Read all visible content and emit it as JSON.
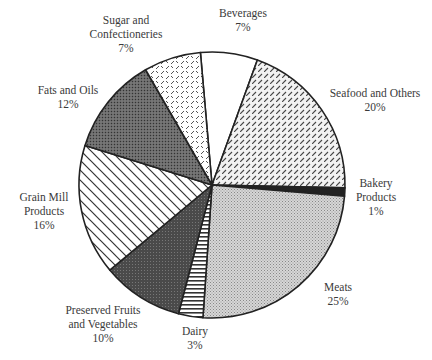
{
  "chart_data": {
    "type": "pie",
    "title": "",
    "start_angle_deg": -5,
    "direction": "clockwise",
    "center": [
      212,
      185
    ],
    "radius": 133,
    "slices": [
      {
        "label": "Beverages",
        "value": 7,
        "pattern": "white",
        "label_lines": [
          "Beverages",
          "7%"
        ],
        "label_pos": [
          243,
          6
        ]
      },
      {
        "label": "Seafood and Others",
        "value": 20,
        "pattern": "diag-dash",
        "label_lines": [
          "Seafood and Others",
          "20%"
        ],
        "label_pos": [
          375,
          86
        ]
      },
      {
        "label": "Bakery Products",
        "value": 1,
        "pattern": "black",
        "label_lines": [
          "Bakery",
          "Products",
          "1%"
        ],
        "label_pos": [
          376,
          176
        ]
      },
      {
        "label": "Meats",
        "value": 25,
        "pattern": "light-dots",
        "label_lines": [
          "Meats",
          "25%"
        ],
        "label_pos": [
          338,
          280
        ]
      },
      {
        "label": "Dairy",
        "value": 3,
        "pattern": "hlines",
        "label_lines": [
          "Dairy",
          "3%"
        ],
        "label_pos": [
          195,
          324
        ]
      },
      {
        "label": "Preserved Fruits and Vegetables",
        "value": 10,
        "pattern": "dark-dots",
        "label_lines": [
          "Preserved Fruits",
          "and Vegetables",
          "10%"
        ],
        "label_pos": [
          103,
          303
        ]
      },
      {
        "label": "Grain Mill Products",
        "value": 16,
        "pattern": "wide-diag",
        "label_lines": [
          "Grain Mill",
          "Products",
          "16%"
        ],
        "label_pos": [
          44,
          190
        ]
      },
      {
        "label": "Fats and Oils",
        "value": 12,
        "pattern": "medium-dots",
        "label_lines": [
          "Fats and Oils",
          "12%"
        ],
        "label_pos": [
          68,
          83
        ]
      },
      {
        "label": "Sugar and Confectioneries",
        "value": 7,
        "pattern": "cross-dash",
        "label_lines": [
          "Sugar and",
          "Confectioneries",
          "7%"
        ],
        "label_pos": [
          126,
          13
        ]
      }
    ],
    "legend": "none",
    "value_unit": "%"
  }
}
